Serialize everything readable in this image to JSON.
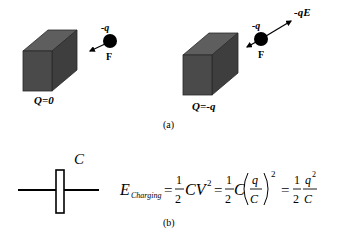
{
  "figure": {
    "panel_a": {
      "caption": "(a)",
      "left": {
        "charge_label": "-q",
        "force_label": "F",
        "block_label": "Q=0"
      },
      "right": {
        "charge_label": "-q",
        "force_label": "F",
        "field_force_label": "-qE",
        "block_label": "Q=-q"
      }
    },
    "panel_b": {
      "caption": "(b)",
      "capacitor_label": "C",
      "equation": {
        "lhs_symbol": "E",
        "lhs_subscript": "Charging",
        "eq1": "=",
        "frac1_num": "1",
        "frac1_den": "2",
        "term1": "CV",
        "term1_exp": "2",
        "eq2": "=",
        "frac2_num": "1",
        "frac2_den": "2",
        "term2": "C",
        "inner_num": "q",
        "inner_den": "C",
        "paren_exp": "2",
        "eq3": "=",
        "frac3_num": "1",
        "frac3_den": "2",
        "frac4_num": "q",
        "frac4_num_exp": "2",
        "frac4_den": "C"
      }
    },
    "colors": {
      "block_front": "#4a4a4a",
      "block_top": "#5e5e5e",
      "block_side": "#3e3e3e",
      "ink": "#000000"
    }
  }
}
